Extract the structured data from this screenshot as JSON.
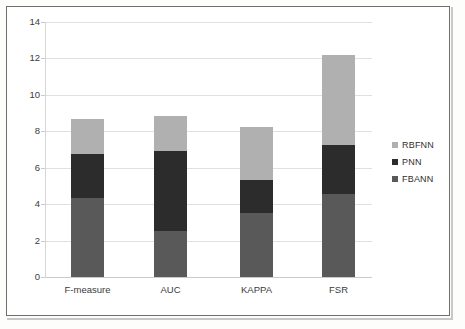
{
  "chart_data": {
    "type": "bar",
    "subtype": "stacked-column",
    "title": "",
    "xlabel": "",
    "ylabel": "",
    "categories": [
      "F-measure",
      "AUC",
      "KAPPA",
      "FSR"
    ],
    "series": [
      {
        "name": "FBANN",
        "color": "#595959",
        "values": [
          4.35,
          2.55,
          3.5,
          4.55
        ]
      },
      {
        "name": "PNN",
        "color": "#2c2c2c",
        "values": [
          2.4,
          4.35,
          1.8,
          2.7
        ]
      },
      {
        "name": "RBFNN",
        "color": "#b0b0b0",
        "values": [
          1.95,
          1.95,
          2.95,
          4.95
        ]
      }
    ],
    "stack_order_bottom_to_top": [
      "FBANN",
      "PNN",
      "RBFNN"
    ],
    "cumulative_tops": {
      "F-measure": [
        4.35,
        6.75,
        8.7
      ],
      "AUC": [
        2.55,
        6.9,
        8.85
      ],
      "KAPPA": [
        3.5,
        5.3,
        8.25
      ],
      "FSR": [
        4.55,
        7.25,
        12.2
      ]
    },
    "totals": [
      8.7,
      8.85,
      8.25,
      12.2
    ],
    "ylim": [
      0,
      14
    ],
    "ytick_step": 2,
    "ytick_labels": [
      "0",
      "2",
      "4",
      "6",
      "8",
      "10",
      "12",
      "14"
    ],
    "grid": true,
    "grid_axis": "y",
    "legend_position": "right",
    "legend_entries": [
      "RBFNN",
      "PNN",
      "FBANN"
    ]
  },
  "axes": {
    "y_ticks": [
      {
        "value": 14,
        "label": "14"
      },
      {
        "value": 12,
        "label": "12"
      },
      {
        "value": 10,
        "label": "10"
      },
      {
        "value": 8,
        "label": "8"
      },
      {
        "value": 6,
        "label": "6"
      },
      {
        "value": 4,
        "label": "4"
      },
      {
        "value": 2,
        "label": "2"
      },
      {
        "value": 0,
        "label": "0"
      }
    ],
    "x_categories": [
      {
        "label": "F-measure"
      },
      {
        "label": "AUC"
      },
      {
        "label": "KAPPA"
      },
      {
        "label": "FSR"
      }
    ]
  },
  "legend": {
    "items": [
      {
        "label": "RBFNN",
        "color": "#b0b0b0"
      },
      {
        "label": "PNN",
        "color": "#2c2c2c"
      },
      {
        "label": "FBANN",
        "color": "#595959"
      }
    ]
  },
  "colors": {
    "rbfnn": "#b0b0b0",
    "pnn": "#2c2c2c",
    "fbann": "#595959",
    "grid": "#dfe0e0",
    "frame": "#6e6e6e",
    "text": "#3b3b3b"
  }
}
